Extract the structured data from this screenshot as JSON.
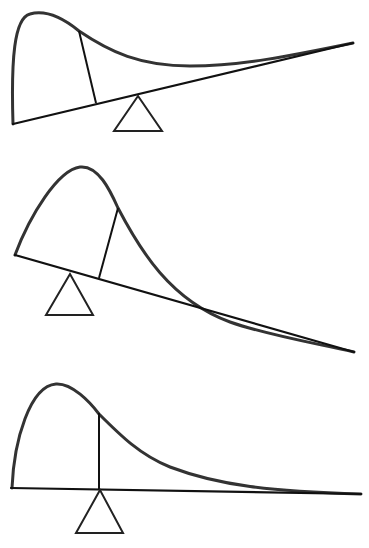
{
  "diagram": {
    "type": "balance-of-skewed-distribution",
    "colors": {
      "background": "#ffffff",
      "curve": "#333333",
      "line": "#111111"
    },
    "panels": [
      {
        "id": "panel-1",
        "state": "tilted-left-down",
        "description": "Distribution resting on a beam tilted up to the right; fulcrum placed right of the divider",
        "baseline": [
          [
            13,
            124
          ],
          [
            353,
            43
          ]
        ],
        "curve_path": "M13,124 C11,60 14,18 30,14 C48,9 68,22 79,31 C110,52 140,66 190,66 C240,66 290,56 353,43",
        "divider": [
          [
            79,
            31
          ],
          [
            96,
            103
          ]
        ],
        "fulcrum": {
          "apex": [
            138,
            96
          ],
          "base_left": [
            114,
            131
          ],
          "base_right": [
            162,
            131
          ]
        }
      },
      {
        "id": "panel-2",
        "state": "tilted-right-down",
        "description": "Distribution resting on a beam tilted down to the right; fulcrum placed left of the divider",
        "baseline": [
          [
            15,
            255
          ],
          [
            354,
            352
          ]
        ],
        "curve_path": "M15,255 C30,215 58,170 80,167 C98,165 110,190 118,208 C140,250 170,300 230,322 C270,336 320,344 354,352",
        "divider": [
          [
            118,
            208
          ],
          [
            99,
            278
          ]
        ],
        "fulcrum": {
          "apex": [
            70,
            274
          ],
          "base_left": [
            46,
            315
          ],
          "base_right": [
            93,
            315
          ]
        }
      },
      {
        "id": "panel-3",
        "state": "balanced",
        "description": "Distribution balanced on a level beam; fulcrum directly under the divider (mean)",
        "baseline": [
          [
            11,
            488
          ],
          [
            361,
            494
          ]
        ],
        "curve_path": "M12,488 C14,440 30,386 56,384 C72,383 90,402 99,414 C120,435 140,455 170,467 C220,486 270,491 361,494",
        "divider": [
          [
            99,
            413
          ],
          [
            99,
            489
          ]
        ],
        "fulcrum": {
          "apex": [
            100,
            494
          ],
          "base_left": [
            76,
            533
          ],
          "base_right": [
            123,
            533
          ]
        }
      }
    ]
  }
}
